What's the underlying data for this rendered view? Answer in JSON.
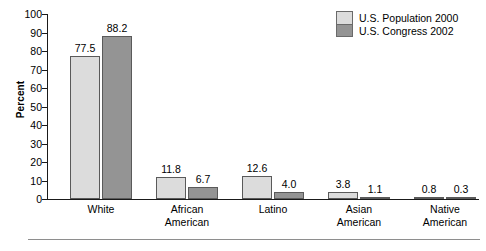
{
  "chart_data": {
    "type": "bar",
    "title": "",
    "xlabel": "",
    "ylabel": "Percent",
    "ylim": [
      0,
      100
    ],
    "ytick_step": 10,
    "yticks": [
      100,
      90,
      80,
      70,
      60,
      50,
      40,
      30,
      20,
      10,
      0
    ],
    "grid": false,
    "legend_position": "top-right",
    "categories": [
      "White",
      "African American",
      "Latino",
      "Asian American",
      "Native American"
    ],
    "category_lines": [
      [
        "White"
      ],
      [
        "African",
        "American"
      ],
      [
        "Latino"
      ],
      [
        "Asian",
        "American"
      ],
      [
        "Native",
        "American"
      ]
    ],
    "series": [
      {
        "name": "U.S. Population 2000",
        "color": "#dcdcdc",
        "values": [
          77.5,
          11.8,
          12.6,
          3.8,
          0.8
        ],
        "labels": [
          "77.5",
          "11.8",
          "12.6",
          "3.8",
          "0.8"
        ]
      },
      {
        "name": "U.S. Congress 2002",
        "color": "#949494",
        "values": [
          88.2,
          6.7,
          4.0,
          1.1,
          0.3
        ],
        "labels": [
          "88.2",
          "6.7",
          "4.0",
          "1.1",
          "0.3"
        ]
      }
    ]
  },
  "legend": {
    "entries": [
      {
        "label": "U.S. Population 2000",
        "swatch": "light-gray"
      },
      {
        "label": "U.S. Congress 2002",
        "swatch": "dark-gray"
      }
    ]
  },
  "axes": {
    "y_title": "Percent",
    "y_labels": [
      "100",
      "90",
      "80",
      "70",
      "60",
      "50",
      "40",
      "30",
      "20",
      "10",
      "0"
    ]
  },
  "colors": {
    "series0": "#dcdcdc",
    "series1": "#949494",
    "bar_border": "#5a5a5a",
    "axis": "#1a1a1a",
    "rule": "#8e8e8e",
    "background": "#ffffff"
  }
}
